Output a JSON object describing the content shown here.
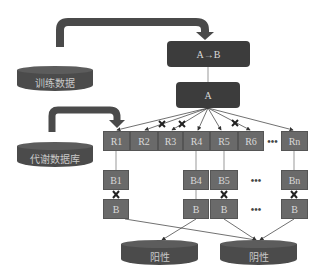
{
  "diagram": {
    "training_data": {
      "label": "训练数据"
    },
    "metabolic_db": {
      "label": "代谢数据库"
    },
    "rule_box": {
      "label": "A→B"
    },
    "antecedent_box": {
      "label": "A"
    },
    "r_row": [
      {
        "label": "R1",
        "pruned": false
      },
      {
        "label": "R2",
        "pruned": true
      },
      {
        "label": "R3",
        "pruned": true
      },
      {
        "label": "R4",
        "pruned": false
      },
      {
        "label": "R5",
        "pruned": false
      },
      {
        "label": "R6",
        "pruned": true
      },
      {
        "label": "Rn",
        "pruned": false
      }
    ],
    "r_ellipsis": "•••",
    "b_row": [
      {
        "label": "B1"
      },
      {
        "label": "B4"
      },
      {
        "label": "B5"
      },
      {
        "label": "Bn"
      }
    ],
    "b_ellipsis": "•••",
    "b_target_row": [
      {
        "label": "B",
        "mismatch": true,
        "outcome": "阴性"
      },
      {
        "label": "B",
        "mismatch": false,
        "outcome": "阳性"
      },
      {
        "label": "B",
        "mismatch": true,
        "outcome": "阴性"
      },
      {
        "label": "B",
        "mismatch": true,
        "outcome": "阴性"
      }
    ],
    "b_target_ellipsis": "•••",
    "positive": {
      "label": "阳性"
    },
    "negative": {
      "label": "阴性"
    },
    "colors": {
      "dark_box": "#3c3c3c",
      "grey_box": "#6a6a6a",
      "arrow": "#4a4a4a",
      "cylinder": "#4b4b4b",
      "text_light": "#d9d9d9"
    }
  }
}
